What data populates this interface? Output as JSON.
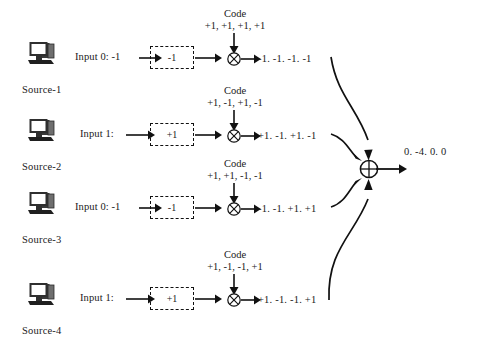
{
  "diagram": {
    "code_title": "Code",
    "final_output": "0. -4. 0. 0",
    "multiplier_symbol": "⊗",
    "summer_symbol": "⊕",
    "icon_names": {
      "source": "computer-icon",
      "multiplier": "circled-times-icon",
      "summer": "circled-plus-icon"
    },
    "colors": {
      "stroke": "#111111",
      "text": "#1a1a1a",
      "background": "#ffffff"
    },
    "rows": [
      {
        "source_label": "Source-1",
        "input_label": "Input 0: -1",
        "symbol_value": "-1",
        "code": "+1, +1, +1, +1",
        "output": "-1. -1. -1. -1"
      },
      {
        "source_label": "Source-2",
        "input_label": "Input 1:",
        "symbol_value": "+1",
        "code": "+1, -1, +1, -1",
        "output": "+1. -1. +1. -1"
      },
      {
        "source_label": "Source-3",
        "input_label": "Input 0: -1",
        "symbol_value": "-1",
        "code": "+1, +1, -1, -1",
        "output": "-1. -1. +1. +1"
      },
      {
        "source_label": "Source-4",
        "input_label": "Input 1:",
        "symbol_value": "+1",
        "code": "+1, -1, -1, +1",
        "output": "+1. -1. -1. +1"
      }
    ]
  }
}
